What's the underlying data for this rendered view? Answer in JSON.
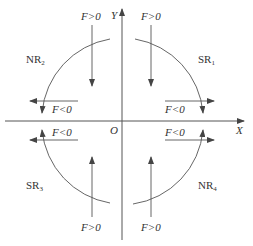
{
  "axes": {
    "x_label": "X",
    "y_label": "Y",
    "origin_label": "O"
  },
  "regions": [
    {
      "id": "SR1",
      "name": "SR",
      "sub": "1",
      "quadrant": "top-right"
    },
    {
      "id": "NR2",
      "name": "NR",
      "sub": "2",
      "quadrant": "top-left"
    },
    {
      "id": "SR3",
      "name": "SR",
      "sub": "3",
      "quadrant": "bottom-left"
    },
    {
      "id": "NR4",
      "name": "NR",
      "sub": "4",
      "quadrant": "bottom-right"
    }
  ],
  "force_labels": {
    "top_left_vertical": "F>0",
    "top_right_vertical": "F>0",
    "bottom_left_vertical": "F>0",
    "bottom_right_vertical": "F>0",
    "top_left_horizontal": "F<0",
    "top_right_horizontal": "F<0",
    "bottom_left_horizontal": "F<0",
    "bottom_right_horizontal": "F<0"
  },
  "colors": {
    "line": "#444444",
    "text": "#333333"
  }
}
